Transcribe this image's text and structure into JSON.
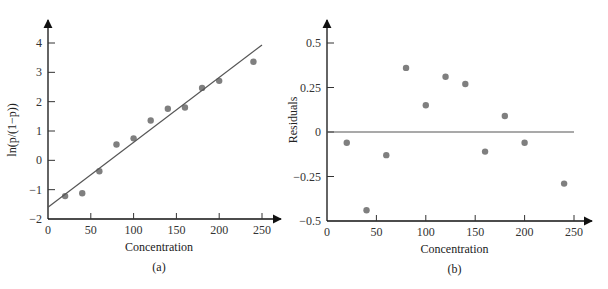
{
  "figure": {
    "caption_visible": false
  },
  "chart_data": [
    {
      "id": "a",
      "type": "scatter",
      "panel_label": "(a)",
      "title": "",
      "xlabel": "Concentration",
      "ylabel": "ln(p/(1−p))",
      "xlim": [
        0,
        250
      ],
      "ylim": [
        -2,
        4
      ],
      "xticks": [
        0,
        50,
        100,
        150,
        200,
        250
      ],
      "yticks": [
        -2,
        -1,
        0,
        1,
        2,
        3,
        4
      ],
      "grid": false,
      "legend": null,
      "series": [
        {
          "name": "observed",
          "kind": "points",
          "color": "#7f7f7f",
          "x": [
            20,
            40,
            60,
            80,
            100,
            120,
            140,
            160,
            180,
            200,
            240
          ],
          "y": [
            -1.22,
            -1.12,
            -0.37,
            0.54,
            0.75,
            1.36,
            1.76,
            1.8,
            2.47,
            2.71,
            3.36
          ]
        },
        {
          "name": "fitted line",
          "kind": "line",
          "color": "#555555",
          "x": [
            0,
            250
          ],
          "y": [
            -1.6,
            3.93
          ]
        }
      ]
    },
    {
      "id": "b",
      "type": "scatter",
      "panel_label": "(b)",
      "title": "",
      "xlabel": "Concentration",
      "ylabel": "Residuals",
      "xlim": [
        0,
        250
      ],
      "ylim": [
        -0.5,
        0.5
      ],
      "xticks": [
        0,
        50,
        100,
        150,
        200,
        250
      ],
      "yticks": [
        -0.5,
        -0.25,
        0,
        0.25,
        0.5
      ],
      "grid": false,
      "legend": null,
      "series": [
        {
          "name": "residuals",
          "kind": "points",
          "color": "#7f7f7f",
          "x": [
            20,
            40,
            60,
            80,
            100,
            120,
            140,
            160,
            180,
            200,
            240
          ],
          "y": [
            -0.06,
            -0.44,
            -0.13,
            0.36,
            0.15,
            0.31,
            0.27,
            -0.11,
            0.09,
            -0.06,
            -0.29
          ]
        },
        {
          "name": "zero line",
          "kind": "line",
          "color": "#555555",
          "x": [
            0,
            250
          ],
          "y": [
            0,
            0
          ]
        }
      ]
    }
  ],
  "layout": {
    "a": {
      "x0": 48,
      "x1": 262,
      "y0": 219,
      "y1": 43,
      "axis_end_x": 281,
      "axis_end_y": 20
    },
    "b": {
      "x0": 327,
      "x1": 574,
      "y0": 221,
      "y1": 43,
      "axis_end_x": 592,
      "axis_end_y": 20
    }
  }
}
